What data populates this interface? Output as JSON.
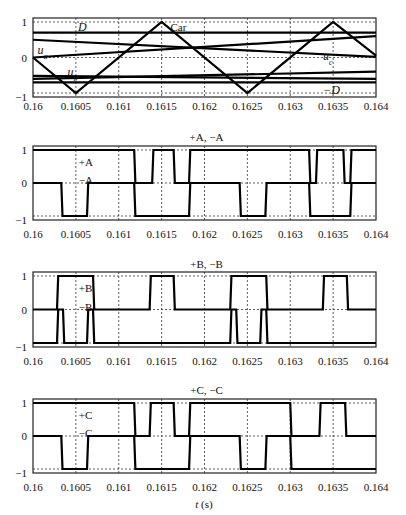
{
  "chart_data": [
    {
      "type": "line",
      "title": "",
      "xlabel": "",
      "ylabel": "",
      "xlim": [
        0.16,
        0.164
      ],
      "ylim": [
        -1,
        1
      ],
      "grid": true,
      "x_ticks": [
        "0.16",
        "0.1605",
        "0.161",
        "0.1615",
        "0.162",
        "0.1625",
        "0.163",
        "0.1635",
        "0.164"
      ],
      "y_ticks": [
        "1",
        "0",
        "−1"
      ],
      "annotations": [
        {
          "text": "D",
          "italic": true,
          "x": 0.1605,
          "y": 0.85
        },
        {
          "text": "Car",
          "italic": false,
          "x": 0.16158,
          "y": 0.85
        },
        {
          "text": "u",
          "sub": "a",
          "italic": true,
          "x": 0.16003,
          "y": 0.22
        },
        {
          "text": "u",
          "sub": "b",
          "italic": true,
          "x": 0.16038,
          "y": -0.42
        },
        {
          "text": "u",
          "sub": "c",
          "italic": true,
          "x": 0.16336,
          "y": 0.05
        },
        {
          "text": "−D",
          "italic": true,
          "x": 0.16336,
          "y": -0.92
        }
      ],
      "series": [
        {
          "name": "Car",
          "x": [
            0.16,
            0.1605,
            0.1615,
            0.1625,
            0.1635,
            0.164
          ],
          "y": [
            0,
            -1,
            1,
            -1,
            1,
            0.05
          ]
        },
        {
          "name": "D",
          "x": [
            0.16,
            0.164
          ],
          "y": [
            0.7,
            0.7
          ]
        },
        {
          "name": "-D",
          "x": [
            0.16,
            0.164
          ],
          "y": [
            -0.7,
            -0.7
          ]
        },
        {
          "name": "u_a",
          "x": [
            0.16,
            0.164
          ],
          "y": [
            0.0,
            0.6
          ]
        },
        {
          "name": "u_b",
          "x": [
            0.16,
            0.164
          ],
          "y": [
            -0.52,
            -0.6
          ]
        },
        {
          "name": "u_c",
          "x": [
            0.16,
            0.164
          ],
          "y": [
            0.5,
            0.02
          ]
        },
        {
          "name": "u_b2",
          "x": [
            0.16,
            0.164
          ],
          "y": [
            -0.6,
            -0.4
          ]
        }
      ]
    },
    {
      "type": "line",
      "title": "+A, −A",
      "xlim": [
        0.16,
        0.164
      ],
      "ylim": [
        -1,
        1
      ],
      "grid": true,
      "x_ticks": [
        "0.16",
        "0.1605",
        "0.161",
        "0.1615",
        "0.162",
        "0.1625",
        "0.163",
        "0.1635",
        "0.164"
      ],
      "y_ticks": [
        "1",
        "0",
        "−1"
      ],
      "annotations": [
        {
          "text": "+A",
          "x": 0.16051,
          "y": 0.65
        },
        {
          "text": "−A",
          "x": 0.16051,
          "y": 0.08
        }
      ],
      "series": [
        {
          "name": "+A",
          "steps": [
            [
              0.16,
              1
            ],
            [
              0.16118,
              0
            ],
            [
              0.16139,
              1
            ],
            [
              0.16164,
              0
            ],
            [
              0.16182,
              1
            ],
            [
              0.16322,
              0
            ],
            [
              0.1633,
              1
            ],
            [
              0.16362,
              0
            ],
            [
              0.1637,
              1
            ]
          ]
        },
        {
          "name": "-A",
          "steps": [
            [
              0.16,
              0
            ],
            [
              0.16033,
              -1
            ],
            [
              0.16063,
              0
            ],
            [
              0.16118,
              -1
            ],
            [
              0.16182,
              0
            ],
            [
              0.16241,
              -1
            ],
            [
              0.16271,
              0
            ],
            [
              0.16322,
              -1
            ],
            [
              0.1637,
              0
            ]
          ]
        }
      ]
    },
    {
      "type": "line",
      "title": "+B, −B",
      "xlim": [
        0.16,
        0.164
      ],
      "ylim": [
        -1,
        1
      ],
      "grid": true,
      "x_ticks": [
        "0.16",
        "0.1605",
        "0.161",
        "0.1615",
        "0.162",
        "0.1625",
        "0.163",
        "0.1635",
        "0.164"
      ],
      "y_ticks": [
        "1",
        "0",
        "−1"
      ],
      "annotations": [
        {
          "text": "+B",
          "x": 0.16051,
          "y": 0.65
        },
        {
          "text": "−B",
          "x": 0.16051,
          "y": 0.08
        }
      ],
      "series": [
        {
          "name": "+B",
          "steps": [
            [
              0.16,
              0
            ],
            [
              0.16028,
              1
            ],
            [
              0.1607,
              0
            ],
            [
              0.16136,
              1
            ],
            [
              0.16164,
              0
            ],
            [
              0.1623,
              1
            ],
            [
              0.16272,
              0
            ],
            [
              0.16338,
              1
            ],
            [
              0.16366,
              0
            ]
          ]
        },
        {
          "name": "-B",
          "steps": [
            [
              0.16,
              -1
            ],
            [
              0.16028,
              0
            ],
            [
              0.16035,
              -1
            ],
            [
              0.16063,
              0
            ],
            [
              0.1607,
              -1
            ],
            [
              0.1623,
              0
            ],
            [
              0.16237,
              -1
            ],
            [
              0.16265,
              0
            ],
            [
              0.16272,
              -1
            ]
          ]
        }
      ]
    },
    {
      "type": "line",
      "title": "+C, −C",
      "xlabel": "t (s)",
      "xlim": [
        0.16,
        0.164
      ],
      "ylim": [
        -1,
        1
      ],
      "grid": true,
      "x_ticks": [
        "0.16",
        "0.1605",
        "0.161",
        "0.1615",
        "0.162",
        "0.1625",
        "0.163",
        "0.1635",
        "0.164"
      ],
      "y_ticks": [
        "1",
        "0",
        "−1"
      ],
      "annotations": [
        {
          "text": "+C",
          "x": 0.16051,
          "y": 0.65
        },
        {
          "text": "−C",
          "x": 0.16051,
          "y": 0.08
        }
      ],
      "series": [
        {
          "name": "+C",
          "steps": [
            [
              0.16,
              1
            ],
            [
              0.16118,
              0
            ],
            [
              0.16136,
              1
            ],
            [
              0.16164,
              0
            ],
            [
              0.16182,
              1
            ],
            [
              0.163,
              0
            ],
            [
              0.16334,
              1
            ],
            [
              0.16364,
              0
            ]
          ]
        },
        {
          "name": "-C",
          "steps": [
            [
              0.16,
              0
            ],
            [
              0.16033,
              -1
            ],
            [
              0.16063,
              0
            ],
            [
              0.16118,
              -1
            ],
            [
              0.16182,
              0
            ],
            [
              0.16241,
              -1
            ],
            [
              0.16271,
              0
            ],
            [
              0.163,
              -1
            ]
          ]
        }
      ]
    }
  ]
}
